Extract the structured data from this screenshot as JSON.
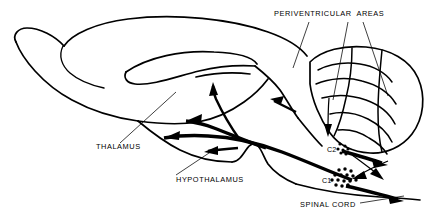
{
  "figure": {
    "background_color": "#ffffff",
    "line_color": "#000000",
    "width": 435,
    "height": 220
  },
  "labels": {
    "periventricular_areas": "PERIVENTRICULAR  AREAS",
    "thalamus": "THALAMUS",
    "hypothalamus": "HYPOTHALAMUS",
    "spinal_cord": "SPINAL CORD",
    "c1": "C1",
    "c2": "C2"
  },
  "cell_groups": [
    {
      "name": "C2",
      "label": "C2",
      "label_x": 327,
      "label_y": 152,
      "dot_radius": 1.6,
      "dots": [
        [
          340,
          144
        ],
        [
          345,
          146
        ],
        [
          338,
          149
        ],
        [
          343,
          150
        ],
        [
          348,
          149
        ],
        [
          341,
          153
        ],
        [
          346,
          154
        ]
      ]
    },
    {
      "name": "C1",
      "label": "C1",
      "label_x": 322,
      "label_y": 183,
      "dot_radius": 1.75,
      "dots": [
        [
          339,
          170
        ],
        [
          345,
          169
        ],
        [
          351,
          171
        ],
        [
          335,
          175
        ],
        [
          341,
          175
        ],
        [
          347,
          175
        ],
        [
          353,
          176
        ],
        [
          332,
          180
        ],
        [
          338,
          180
        ],
        [
          344,
          181
        ],
        [
          350,
          181
        ],
        [
          356,
          180
        ],
        [
          336,
          185
        ],
        [
          342,
          186
        ],
        [
          348,
          185
        ]
      ]
    }
  ],
  "leader_lines": [
    {
      "name": "periventricular-leader-1",
      "x1": 309,
      "y1": 22,
      "x2": 293,
      "y2": 68
    },
    {
      "name": "periventricular-leader-2",
      "x1": 348,
      "y1": 22,
      "x2": 333,
      "y2": 100
    },
    {
      "name": "periventricular-leader-3",
      "x1": 363,
      "y1": 22,
      "x2": 388,
      "y2": 96
    },
    {
      "name": "thalamus-leader",
      "x1": 120,
      "y1": 143,
      "x2": 176,
      "y2": 92
    },
    {
      "name": "hypothalamus-leader",
      "x1": 176,
      "y1": 175,
      "x2": 212,
      "y2": 151
    },
    {
      "name": "spinal-cord-leader",
      "x1": 360,
      "y1": 203,
      "x2": 404,
      "y2": 196
    }
  ],
  "label_positions": {
    "periventricular_areas": {
      "x": 274,
      "y": 16
    },
    "thalamus": {
      "x": 96,
      "y": 149
    },
    "hypothalamus": {
      "x": 176,
      "y": 182
    },
    "spinal_cord": {
      "x": 300,
      "y": 207
    }
  }
}
